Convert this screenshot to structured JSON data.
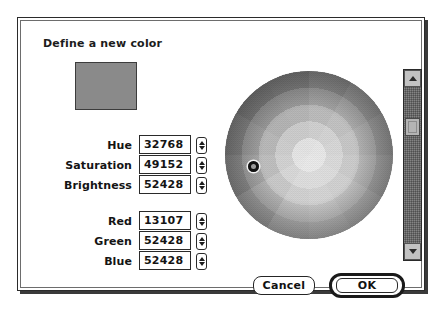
{
  "dialog": {
    "title": "Define a new color",
    "swatch_color": "#8a8a8a"
  },
  "fields": {
    "hsb": [
      {
        "label": "Hue",
        "value": "32768",
        "stepper": "stepper-up-down-icon"
      },
      {
        "label": "Saturation",
        "value": "49152",
        "stepper": "stepper-up-down-icon"
      },
      {
        "label": "Brightness",
        "value": "52428",
        "stepper": "stepper-up-down-icon"
      }
    ],
    "rgb": [
      {
        "label": "Red",
        "value": "13107",
        "stepper": "stepper-up-down-icon"
      },
      {
        "label": "Green",
        "value": "52428",
        "stepper": "stepper-up-down-icon"
      },
      {
        "label": "Blue",
        "value": "52428",
        "stepper": "stepper-up-down-icon"
      }
    ]
  },
  "wheel": {
    "marker_x_pct": 17,
    "marker_y_pct": 57,
    "rings": 5,
    "sectors": 12
  },
  "scrollbar": {
    "up_arrow": "arrow-up-icon",
    "down_arrow": "arrow-down-icon",
    "thumb_position_pct": 20
  },
  "buttons": {
    "cancel": "Cancel",
    "ok": "OK"
  }
}
